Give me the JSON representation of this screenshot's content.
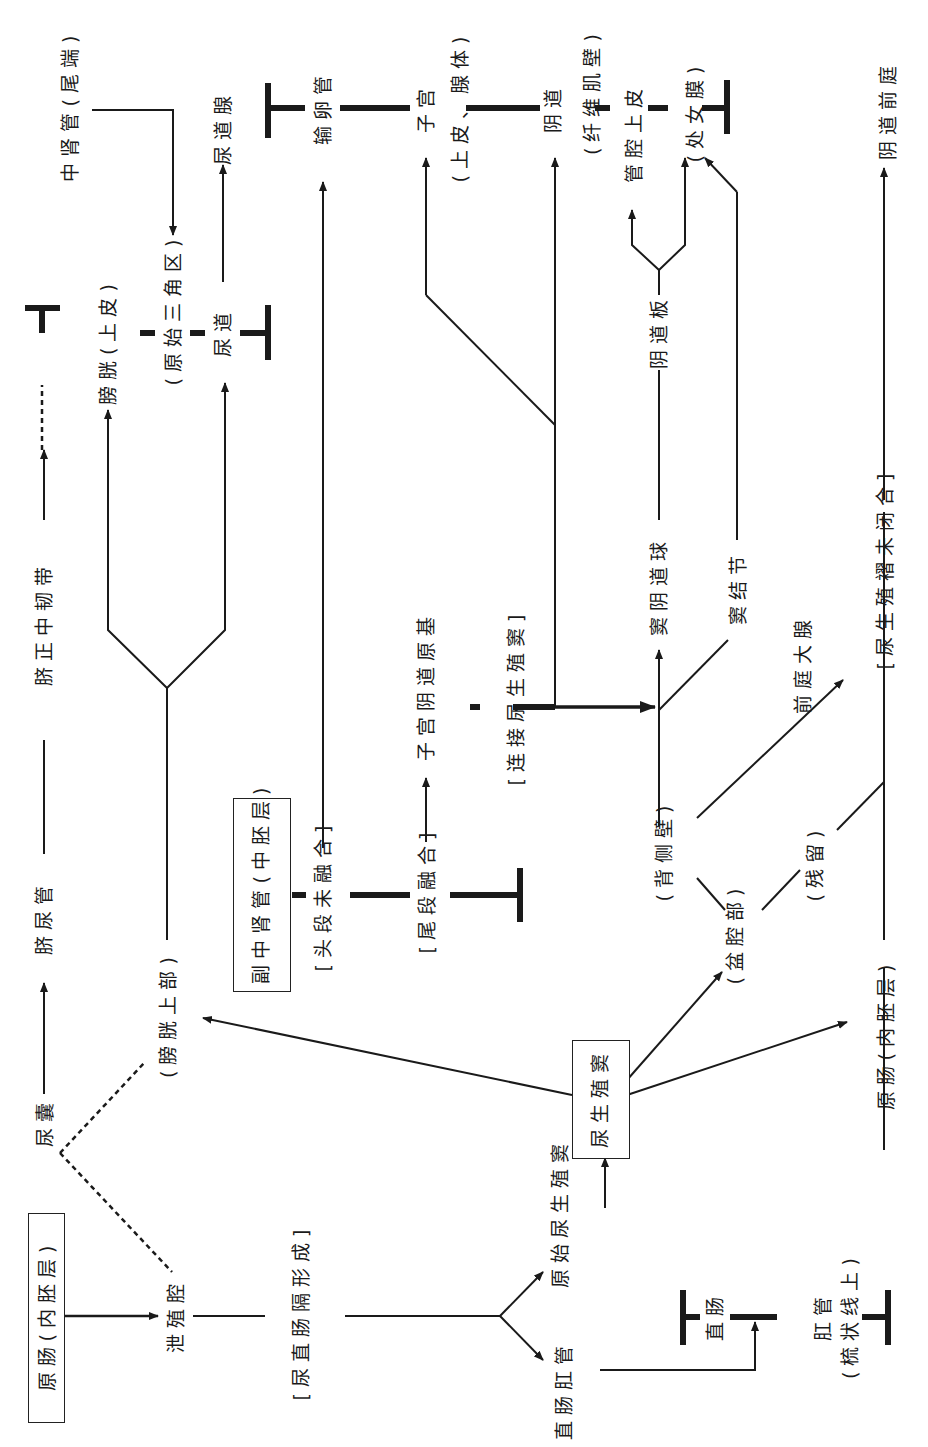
{
  "diagram": {
    "orientation": "rotated-90-ccw",
    "nodes": {
      "primitive_gut_left": "原肠(内胚层)",
      "cloaca": "泄殖腔",
      "allantois": "尿囊",
      "urachus": "脐尿管",
      "median_umbilical_ligament": "脐正中韧带",
      "bladder_upper": "(膀胱上部)",
      "bladder_epithelium": "膀胱(上皮)",
      "trigone": "(原始三角区)",
      "urethra": "尿道",
      "urethral_glands": "尿道腺",
      "mesonephric_duct": "中肾管(尾端)",
      "paramesonephric_duct": "副中肾管(中胚层)",
      "cranial_unfused": "[头段未融合]",
      "caudal_fused": "[尾段融合]",
      "uterovaginal_primordium": "子宫阴道原基",
      "connect_ugs": "[连接尿生殖窦]",
      "oviduct": "输卵管",
      "uterus": "子宫",
      "uterus_detail": "(上皮、腺体)",
      "vagina": "阴道",
      "vagina_detail": "(纤维肌壁)",
      "lumen_epithelium": "管腔上皮",
      "hymen": "(处女膜)",
      "vaginal_plate": "阴道板",
      "sinovaginal_bulb": "窦阴道球",
      "sinus_tubercle": "窦结节",
      "vestibular_gland": "前庭大腺",
      "dorsal_wall": "(背侧壁)",
      "pelvic_part": "(盆腔部)",
      "remnant": "(残留)",
      "ug_fold_unclosed": "[尿生殖褶未闭合]",
      "vaginal_vestibule": "阴道前庭",
      "primitive_gut_right": "原肠(内胚层)",
      "urorectal_septum": "[尿直肠隔形成]",
      "anorectal_canal": "直肠肛管",
      "primitive_ugs": "原始尿生殖窦",
      "urogenital_sinus": "尿生殖窦",
      "rectum": "直肠",
      "anal_canal": "肛管",
      "anal_canal_detail": "(梳状线上)"
    },
    "colors": {
      "ink": "#1a1a1a",
      "background": "#ffffff"
    }
  }
}
